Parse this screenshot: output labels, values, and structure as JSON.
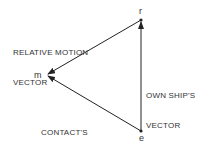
{
  "diagram": {
    "type": "vector-triangle",
    "points": {
      "r": {
        "label": "r",
        "x": 141,
        "y": 20
      },
      "m": {
        "label": "m",
        "x": 47,
        "y": 75
      },
      "e": {
        "label": "e",
        "x": 141,
        "y": 131
      }
    },
    "vectors": [
      {
        "name": "relative-motion-vector",
        "from": "r",
        "to": "m",
        "label_line1": "RELATIVE MOTION",
        "label_line2": "VECTOR"
      },
      {
        "name": "contacts-vector",
        "from": "e",
        "to": "m",
        "label_line1": "CONTACT'S",
        "label_line2": "VECTOR"
      },
      {
        "name": "own-ships-vector",
        "from": "e",
        "to": "r",
        "label_line1": "OWN SHIP'S",
        "label_line2": "VECTOR"
      }
    ],
    "line_color": "#222222"
  }
}
